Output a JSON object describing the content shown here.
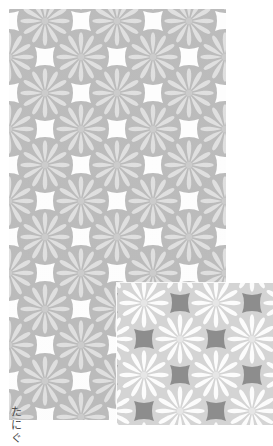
{
  "page": {
    "background_color": "#ffffff",
    "width": 273,
    "height": 446
  },
  "caption": {
    "line1": "た",
    "line2": "に",
    "line3": "ぐ"
  },
  "main_swatch": {
    "name": "main-pattern-swatch",
    "colorway_label": "light gray",
    "background_color": "#fdfdfd",
    "circle_color": "#b4b4b4",
    "petal_color": "#dcdcdc",
    "center_color": "#c6c6c6",
    "circle_radius": 28,
    "petal_count": 12,
    "grid_spacing_x": 72,
    "grid_spacing_y": 36,
    "x": 9,
    "y": 9,
    "width": 217,
    "height": 411
  },
  "inset_swatch": {
    "name": "dark-colorway-inset",
    "colorway_label": "dark gray",
    "background_color": "#8d8d8d",
    "circle_color": "#d4d4d4",
    "petal_color": "#fcfcfc",
    "center_color": "#e6e6e6",
    "circle_radius": 28,
    "petal_count": 12,
    "grid_spacing_x": 72,
    "grid_spacing_y": 36,
    "x": 117,
    "y": 283,
    "width": 156,
    "height": 142
  },
  "pattern": {
    "motif_name": "kikyo-chrysanthemum-roundel",
    "motif_type": "radial-petal-roundel",
    "layout": "staggered-half-drop-grid",
    "petal_count": 12
  }
}
